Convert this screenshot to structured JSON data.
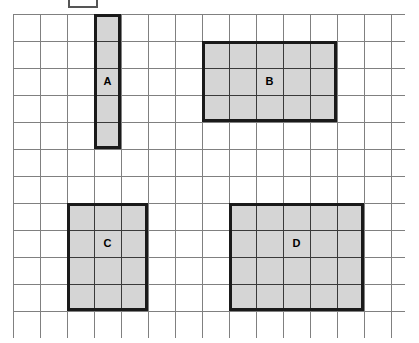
{
  "page": {
    "background_color": "#ffffff",
    "width": 419,
    "height": 343
  },
  "legend_key": {
    "name": "unit-square-key",
    "label": "",
    "x": 68,
    "y": -6,
    "width": 30,
    "height": 14,
    "border_color": "#555555",
    "fill_color": "#ffffff"
  },
  "grid": {
    "origin_x": 13,
    "origin_y": 14,
    "cell_size": 27,
    "cols": 14.5,
    "rows": 12,
    "line_color": "#808080",
    "line_width": 1,
    "background_color": "#ffffff"
  },
  "style": {
    "shape_fill": "#d5d5d5",
    "shape_border": "#1a1a1a",
    "shape_border_width": 3,
    "shape_inner_line": "#3a3a3a",
    "label_color": "#000000"
  },
  "shapes": [
    {
      "label": "A",
      "col": 3,
      "row": 0,
      "cols_wide": 1,
      "rows_tall": 5,
      "area_units": 5,
      "perimeter_units": 12,
      "label_row_offset": 2
    },
    {
      "label": "B",
      "col": 7,
      "row": 1,
      "cols_wide": 5,
      "rows_tall": 3,
      "area_units": 15,
      "perimeter_units": 16,
      "label_row_offset": 1
    },
    {
      "label": "C",
      "col": 2,
      "row": 7,
      "cols_wide": 3,
      "rows_tall": 4,
      "area_units": 12,
      "perimeter_units": 14,
      "label_row_offset": 1
    },
    {
      "label": "D",
      "col": 8,
      "row": 7,
      "cols_wide": 5,
      "rows_tall": 4,
      "area_units": 20,
      "perimeter_units": 18,
      "label_row_offset": 1
    }
  ]
}
